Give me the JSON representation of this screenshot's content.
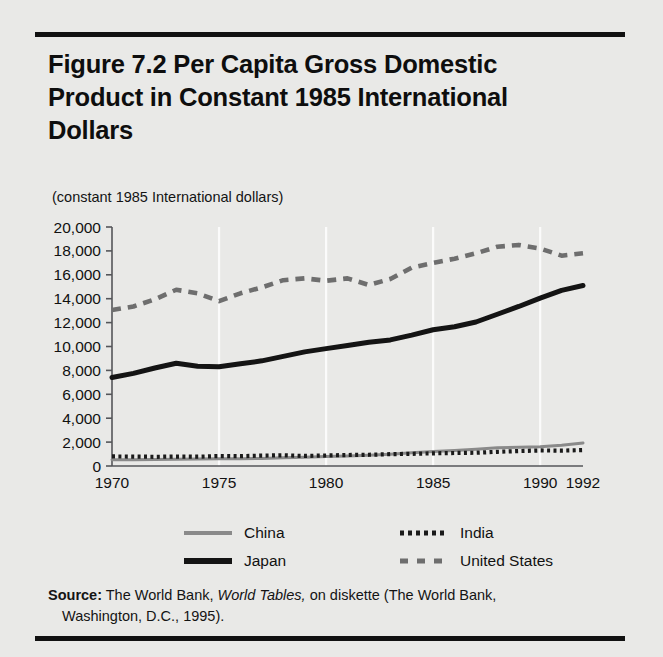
{
  "figure": {
    "title": "Figure 7.2  Per Capita Gross Domestic Product in Constant 1985 International Dollars",
    "subtitle": "(constant 1985 International dollars)"
  },
  "source": {
    "label": "Source:",
    "text_before_italic": " The World Bank, ",
    "italic_title": "World Tables,",
    "text_after_italic": " on diskette (The World Bank,",
    "second_line": "Washington, D.C., 1995)."
  },
  "legend": {
    "china": "China",
    "japan": "Japan",
    "india": "India",
    "united_states": "United States"
  },
  "colors": {
    "background": "#e9e9e7",
    "rule": "#111111",
    "axis": "#55565a",
    "gridline": "#fbfbfb",
    "china": "#8a8a8a",
    "japan": "#141414",
    "india": "#1a1a1a",
    "united_states": "#6e6e6e",
    "text": "#111111"
  },
  "chart_data": {
    "type": "line",
    "title": "Figure 7.2  Per Capita Gross Domestic Product in Constant 1985 International Dollars",
    "subtitle": "(constant 1985 International dollars)",
    "xlabel": "",
    "ylabel": "(constant 1985 International dollars)",
    "x": [
      1970,
      1971,
      1972,
      1973,
      1974,
      1975,
      1976,
      1977,
      1978,
      1979,
      1980,
      1981,
      1982,
      1983,
      1984,
      1985,
      1986,
      1987,
      1988,
      1989,
      1990,
      1991,
      1992
    ],
    "xlim": [
      1970,
      1992
    ],
    "ylim": [
      0,
      20000
    ],
    "xticks": [
      1970,
      1975,
      1980,
      1985,
      1990,
      1992
    ],
    "xticklabels": [
      "1970",
      "1975",
      "1980",
      "1985",
      "1990",
      "1992"
    ],
    "yticks": [
      0,
      2000,
      4000,
      6000,
      8000,
      10000,
      12000,
      14000,
      16000,
      18000,
      20000
    ],
    "yticklabels": [
      "0",
      "2,000",
      "4,000",
      "6,000",
      "8,000",
      "10,000",
      "12,000",
      "14,000",
      "16,000",
      "18,000",
      "20,000"
    ],
    "grid": "vertical-only",
    "legend_position": "below-axes",
    "series": [
      {
        "name": "China",
        "style": "solid-thin",
        "color": "#8a8a8a",
        "values": [
          520,
          530,
          540,
          570,
          580,
          610,
          600,
          630,
          690,
          740,
          800,
          840,
          910,
          990,
          1100,
          1220,
          1300,
          1400,
          1520,
          1570,
          1610,
          1740,
          1930
        ]
      },
      {
        "name": "India",
        "style": "dotted",
        "color": "#1a1a1a",
        "values": [
          800,
          790,
          770,
          790,
          780,
          830,
          820,
          870,
          900,
          840,
          880,
          920,
          940,
          990,
          1020,
          1060,
          1090,
          1110,
          1190,
          1250,
          1300,
          1290,
          1330
        ]
      },
      {
        "name": "Japan",
        "style": "solid-thick",
        "color": "#141414",
        "values": [
          7400,
          7750,
          8200,
          8600,
          8350,
          8300,
          8550,
          8800,
          9170,
          9550,
          9820,
          10080,
          10350,
          10550,
          10950,
          11400,
          11650,
          12050,
          12700,
          13350,
          14050,
          14700,
          15100
        ]
      },
      {
        "name": "United States",
        "style": "dashed",
        "color": "#6e6e6e",
        "values": [
          13050,
          13350,
          13950,
          14750,
          14450,
          13800,
          14450,
          14950,
          15550,
          15700,
          15500,
          15700,
          15150,
          15650,
          16600,
          17000,
          17350,
          17800,
          18350,
          18500,
          18200,
          17600,
          17800
        ]
      }
    ]
  },
  "axis_geometry": {
    "left": 112,
    "right": 583,
    "top": 227,
    "bottom": 466
  }
}
